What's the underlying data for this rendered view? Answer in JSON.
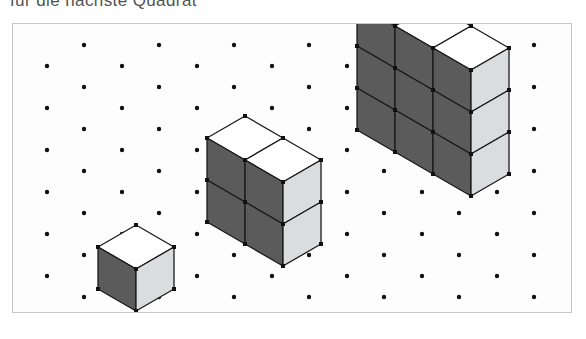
{
  "caption": {
    "text": "für die nächste Quadrat",
    "note": "partially cut off at top edge of scan"
  },
  "figure": {
    "frame": {
      "x": 12,
      "y": 23,
      "width": 560,
      "height": 290,
      "border_color": "#c9c9c9",
      "background": "#fdfdfd"
    },
    "colors": {
      "face_left_dark": "#5b5b5b",
      "face_right_light": "#d9dddd",
      "face_top_white": "#ffffff",
      "edge_stroke": "#1a1a1a",
      "vertex_dot": "#111111",
      "grid_dot": "#111111"
    },
    "grid": {
      "type": "isometric-dot-grid",
      "dot_radius": 2.2,
      "column_spacing": 75,
      "row_spacing": 21,
      "row_offset": 37,
      "origin_x": 35,
      "origin_y": 1,
      "columns": 8,
      "rows": 14
    },
    "projection": {
      "half_width": 38,
      "half_depth": 22,
      "cube_height": 42
    },
    "structures": [
      {
        "name": "structure-1",
        "label": "1",
        "cubes": 1,
        "columns": 1,
        "rows": 1,
        "origin_x": 124,
        "origin_y": 246,
        "bounds": {
          "left": 85,
          "top": 203,
          "right": 162,
          "bottom": 288
        }
      },
      {
        "name": "structure-2",
        "label": "4",
        "cubes": 4,
        "columns": 2,
        "rows": 2,
        "origin_x": 233,
        "origin_y": 179,
        "bounds": {
          "left": 196,
          "top": 136,
          "right": 310,
          "bottom": 270
        }
      },
      {
        "name": "structure-3",
        "label": "9",
        "cubes": 9,
        "columns": 3,
        "rows": 3,
        "origin_x": 383,
        "origin_y": 87,
        "bounds": {
          "left": 345,
          "top": 44,
          "right": 498,
          "bottom": 268
        }
      }
    ],
    "sequence": {
      "description": "square numbers",
      "values": [
        1,
        4,
        9
      ],
      "next_value": 16
    }
  }
}
